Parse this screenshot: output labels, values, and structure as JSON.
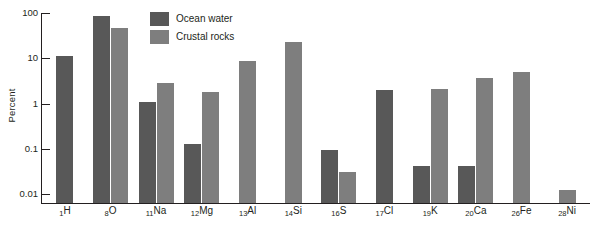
{
  "chart_data": {
    "type": "bar",
    "title": "",
    "xlabel": "",
    "ylabel": "Percent",
    "scale": "log",
    "ylim": [
      0.01,
      100
    ],
    "ytick_labels": [
      "100",
      "10",
      "1",
      "0.1",
      "0.01"
    ],
    "ytick_values": [
      100,
      10,
      1,
      0.1,
      0.01
    ],
    "grid": false,
    "legend_position": "top-center",
    "categories": [
      "₁H",
      "₈O",
      "₁₁Na",
      "₁₂Mg",
      "₁₃Al",
      "₁₄Si",
      "₁₆S",
      "₁₇Cl",
      "₁₉K",
      "₂₀Ca",
      "₂₆Fe",
      "₂₈Ni"
    ],
    "category_parts": [
      {
        "number": "1",
        "symbol": "H"
      },
      {
        "number": "8",
        "symbol": "O"
      },
      {
        "number": "11",
        "symbol": "Na"
      },
      {
        "number": "12",
        "symbol": "Mg"
      },
      {
        "number": "13",
        "symbol": "Al"
      },
      {
        "number": "14",
        "symbol": "Si"
      },
      {
        "number": "16",
        "symbol": "S"
      },
      {
        "number": "17",
        "symbol": "Cl"
      },
      {
        "number": "19",
        "symbol": "K"
      },
      {
        "number": "20",
        "symbol": "Ca"
      },
      {
        "number": "26",
        "symbol": "Fe"
      },
      {
        "number": "28",
        "symbol": "Ni"
      }
    ],
    "series": [
      {
        "name": "Ocean water",
        "color": "#585858",
        "values": [
          11.2,
          88.0,
          1.08,
          0.13,
          null,
          null,
          0.093,
          2.0,
          0.042,
          0.042,
          null,
          null
        ]
      },
      {
        "name": "Crustal rocks",
        "color": "#7e7e7e",
        "values": [
          null,
          47.0,
          2.8,
          1.8,
          8.5,
          23.0,
          0.03,
          null,
          2.1,
          3.6,
          5.0,
          0.012
        ]
      }
    ]
  },
  "legend": {
    "items": [
      {
        "label": "Ocean water",
        "color": "#585858"
      },
      {
        "label": "Crustal rocks",
        "color": "#7e7e7e"
      }
    ]
  },
  "axis": {
    "y_title": "Percent"
  }
}
